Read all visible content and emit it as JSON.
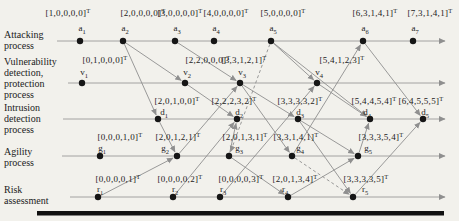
{
  "figure": {
    "background": "#f2f1ec",
    "edge_color": "#8f8f8f",
    "axis_color": "#9a9a9a",
    "dot_color": "#161616",
    "text_color": "#222222",
    "bar_color": "#111111",
    "notation_sup": "T",
    "axis_end_x": 445,
    "bottom_bar": {
      "x": 37,
      "y": 211,
      "w": 407,
      "h": 4.5
    },
    "rows": [
      {
        "id": "attack",
        "y": 41,
        "axis_start": 57,
        "label_x": 4,
        "label_first_y": 38,
        "lines": [
          "Attacking",
          "process"
        ],
        "vec_y": 16,
        "name_y": 31
      },
      {
        "id": "vuln",
        "y": 83,
        "axis_start": 68,
        "label_x": 4,
        "label_first_y": 65,
        "lines": [
          "Vulnerability",
          "detection,",
          "protection",
          "process"
        ],
        "vec_y": 63,
        "name_y": 75
      },
      {
        "id": "intrusion",
        "y": 119,
        "axis_start": 63,
        "label_x": 4,
        "label_first_y": 111,
        "lines": [
          "Intrusion",
          "detection",
          "process"
        ],
        "vec_y": 104,
        "name_y": 115
      },
      {
        "id": "agility",
        "y": 156,
        "axis_start": 62,
        "label_x": 4,
        "label_first_y": 155,
        "lines": [
          "Agility",
          "process"
        ],
        "vec_y": 140,
        "name_y": 151
      },
      {
        "id": "risk",
        "y": 197,
        "axis_start": 70,
        "label_x": 4,
        "label_first_y": 193,
        "lines": [
          "Risk",
          "assessment"
        ],
        "vec_y": 182,
        "name_y": 192
      }
    ],
    "nodes": [
      {
        "id": "a1",
        "base": "a",
        "sub": "1",
        "vector": "[1,0,0,0,0]",
        "row": "attack",
        "x": 80,
        "ldx": -12
      },
      {
        "id": "a2",
        "base": "a",
        "sub": "2",
        "vector": "[2,0,0,0,0]",
        "row": "attack",
        "x": 123,
        "ldx": 20
      },
      {
        "id": "a3",
        "base": "a",
        "sub": "3",
        "vector": "[3,0,0,0,0]",
        "row": "attack",
        "x": 175,
        "ldx": 5
      },
      {
        "id": "a4",
        "base": "a",
        "sub": "4",
        "vector": "[4,0,0,0,0]",
        "row": "attack",
        "x": 214,
        "ldx": 12
      },
      {
        "id": "a5",
        "base": "a",
        "sub": "5",
        "vector": "[5,0,0,0,0]",
        "row": "attack",
        "x": 271,
        "ldx": 12
      },
      {
        "id": "a6",
        "base": "a",
        "sub": "6",
        "vector": "[6,3,1,4,1]",
        "row": "attack",
        "x": 363,
        "ldx": 12
      },
      {
        "id": "a7",
        "base": "a",
        "sub": "7",
        "vector": "[7,3,1,4,1]",
        "row": "attack",
        "x": 413,
        "ldx": 17
      },
      {
        "id": "v1",
        "base": "v",
        "sub": "1",
        "vector": "[0,1,0,0,0]",
        "row": "vuln",
        "x": 82,
        "ldx": 23
      },
      {
        "id": "v2",
        "base": "v",
        "sub": "2",
        "vector": "[2,2,0,0,0]",
        "row": "vuln",
        "x": 185,
        "ldx": 23
      },
      {
        "id": "v3",
        "base": "v",
        "sub": "3",
        "vector": "[3,3,1,2,1]",
        "row": "vuln",
        "x": 240,
        "ldx": 4
      },
      {
        "id": "v4",
        "base": "v",
        "sub": "4",
        "vector": "[5,4,1,2,3]",
        "row": "vuln",
        "x": 317,
        "ldx": 25
      },
      {
        "id": "d1",
        "base": "d",
        "sub": "1",
        "vector": "[2,0,1,0,0]",
        "row": "intrusion",
        "x": 158,
        "ldx": 19,
        "ndx": 6
      },
      {
        "id": "d2",
        "base": "d",
        "sub": "2",
        "vector": "[2,2,2,3,2]",
        "row": "intrusion",
        "x": 237,
        "ldx": -3
      },
      {
        "id": "d3",
        "base": "d",
        "sub": "3",
        "vector": "[3,3,3,3,2]",
        "row": "intrusion",
        "x": 298,
        "ldx": 2
      },
      {
        "id": "d4",
        "base": "d",
        "sub": "4",
        "vector": "[5,4,4,5,4]",
        "row": "intrusion",
        "x": 370,
        "ldx": 4,
        "ndx": -3
      },
      {
        "id": "d5",
        "base": "d",
        "sub": "5",
        "vector": "[6,4,5,5,5]",
        "row": "intrusion",
        "x": 423,
        "ldx": -2
      },
      {
        "id": "g1",
        "base": "g",
        "sub": "1",
        "vector": "[0,0,0,1,0]",
        "row": "agility",
        "x": 100,
        "ldx": 20
      },
      {
        "id": "g2",
        "base": "g",
        "sub": "2",
        "vector": "[2,0,1,2,1]",
        "row": "agility",
        "x": 177,
        "ldx": 1,
        "ndx": -12
      },
      {
        "id": "g3",
        "base": "g",
        "sub": "3",
        "vector": "[2,0,1,3,1]",
        "row": "agility",
        "x": 229,
        "ldx": 16,
        "ndx": 10
      },
      {
        "id": "g4",
        "base": "g",
        "sub": "4",
        "vector": "[3,3,1,4,1]",
        "row": "agility",
        "x": 292,
        "ldx": 4,
        "ndx": 8
      },
      {
        "id": "g5",
        "base": "g",
        "sub": "5",
        "vector": "[3,3,3,5,4]",
        "row": "agility",
        "x": 358,
        "ldx": 23,
        "ndx": 10
      },
      {
        "id": "r1",
        "base": "r",
        "sub": "1",
        "vector": "[0,0,0,0,1]",
        "row": "risk",
        "x": 98,
        "ldx": 20
      },
      {
        "id": "r2",
        "base": "r",
        "sub": "2",
        "vector": "[0,0,0,0,2]",
        "row": "risk",
        "x": 173,
        "ldx": 7
      },
      {
        "id": "r3",
        "base": "r",
        "sub": "3",
        "vector": "[0,0,0,0,3]",
        "row": "risk",
        "x": 220,
        "ldx": 21,
        "ndx": 3
      },
      {
        "id": "r4",
        "base": "r",
        "sub": "4",
        "vector": "[2,0,1,3,4]",
        "row": "risk",
        "x": 288,
        "ldx": 7,
        "ndx": -3
      },
      {
        "id": "r5",
        "base": "r",
        "sub": "5",
        "vector": "[3,3,3,3,5]",
        "row": "risk",
        "x": 353,
        "ldx": 13,
        "ndx": 12
      }
    ],
    "edges": [
      {
        "from": "a2",
        "to": "v2",
        "style": "solid"
      },
      {
        "from": "a2",
        "to": "d1",
        "style": "solid"
      },
      {
        "from": "a3",
        "to": "v3",
        "style": "solid"
      },
      {
        "from": "a5",
        "to": "v4",
        "style": "solid"
      },
      {
        "from": "a5",
        "to": "d4",
        "style": "solid"
      },
      {
        "from": "a6",
        "to": "d5",
        "style": "solid"
      },
      {
        "from": "g4",
        "to": "a6",
        "style": "solid"
      },
      {
        "from": "d1",
        "to": "g2",
        "style": "solid"
      },
      {
        "from": "r1",
        "to": "g2",
        "style": "solid"
      },
      {
        "from": "g2",
        "to": "v3",
        "style": "solid"
      },
      {
        "from": "v2",
        "to": "d2",
        "style": "solid"
      },
      {
        "from": "g3",
        "to": "d2",
        "style": "solid"
      },
      {
        "from": "r2",
        "to": "d2",
        "style": "solid"
      },
      {
        "from": "v3",
        "to": "d3",
        "style": "solid"
      },
      {
        "from": "v3",
        "to": "g4",
        "style": "solid"
      },
      {
        "from": "g3",
        "to": "r4",
        "style": "solid"
      },
      {
        "from": "r3",
        "to": "v4",
        "style": "solid"
      },
      {
        "from": "d3",
        "to": "g5",
        "style": "solid"
      },
      {
        "from": "d3",
        "to": "r5",
        "style": "solid"
      },
      {
        "from": "r4",
        "to": "g5",
        "style": "solid"
      },
      {
        "from": "g5",
        "to": "d4",
        "style": "solid"
      },
      {
        "from": "v4",
        "to": "d4",
        "style": "solid"
      },
      {
        "from": "r5",
        "to": "d5",
        "style": "solid"
      },
      {
        "from": "a5",
        "to": "g3",
        "style": "dashed"
      },
      {
        "from": "g4",
        "to": "r5",
        "style": "dashed"
      }
    ]
  }
}
